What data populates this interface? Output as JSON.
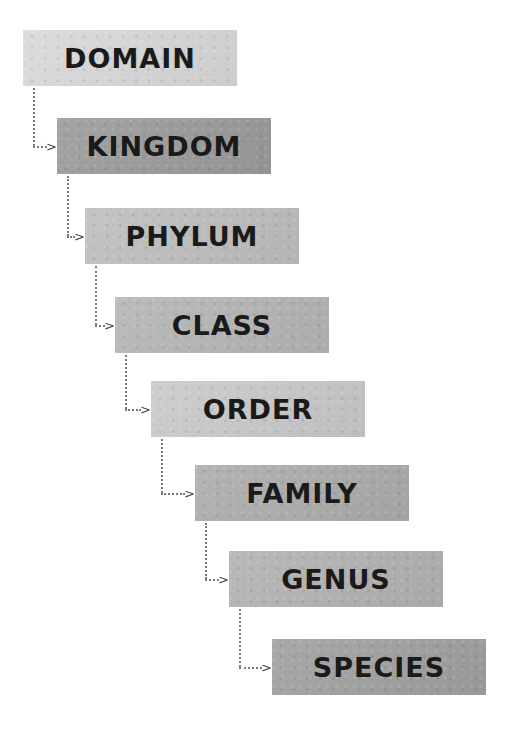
{
  "diagram": {
    "type": "taxonomic-hierarchy",
    "ranks": [
      {
        "label": "DOMAIN",
        "color": "#d9d9d9"
      },
      {
        "label": "KINGDOM",
        "color": "#9c9c9c"
      },
      {
        "label": "PHYLUM",
        "color": "#bfbfbf"
      },
      {
        "label": "CLASS",
        "color": "#b6b6b6"
      },
      {
        "label": "ORDER",
        "color": "#cacaca"
      },
      {
        "label": "FAMILY",
        "color": "#adadad"
      },
      {
        "label": "GENUS",
        "color": "#b3b3b3"
      },
      {
        "label": "SPECIES",
        "color": "#a1a1a1"
      }
    ],
    "connector_icon": "dotted-arrow-icon",
    "arrow_glyph": ">"
  }
}
